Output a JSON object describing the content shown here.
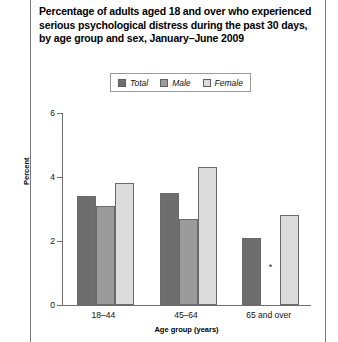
{
  "title": "Percentage of adults aged 18 and over who experienced serious psychological distress during the past 30 days, by age group and sex, January–June 2009",
  "colors": {
    "total": "#6e6e6e",
    "male": "#9b9b9b",
    "female": "#dcdcdc",
    "axis": "#6e6e6e",
    "border": "#6a6a6a"
  },
  "legend": {
    "items": [
      {
        "label": "Total",
        "color": "#6e6e6e"
      },
      {
        "label": "Male",
        "color": "#9b9b9b"
      },
      {
        "label": "Female",
        "color": "#dcdcdc"
      }
    ]
  },
  "footnote_marker": "*",
  "chart_data": {
    "type": "bar",
    "title": "Percentage of adults aged 18 and over who experienced serious psychological distress during the past 30 days, by age group and sex, January–June 2009",
    "xlabel": "Age group (years)",
    "ylabel": "Percent",
    "ylim": [
      0,
      6
    ],
    "yticks": [
      0,
      2,
      4,
      6
    ],
    "ytick_labels": [
      "0",
      "2",
      "4",
      "6"
    ],
    "grid": false,
    "legend_position": "top-center",
    "categories": [
      "18–44",
      "45–64",
      "65 and over"
    ],
    "series": [
      {
        "name": "Total",
        "values": [
          3.4,
          3.5,
          2.1
        ]
      },
      {
        "name": "Male",
        "values": [
          3.1,
          2.7,
          null
        ]
      },
      {
        "name": "Female",
        "values": [
          3.8,
          4.3,
          2.8
        ]
      }
    ],
    "annotations": [
      {
        "text": "*",
        "series": "Male",
        "category": "65 and over",
        "note": "estimate not shown"
      }
    ]
  }
}
